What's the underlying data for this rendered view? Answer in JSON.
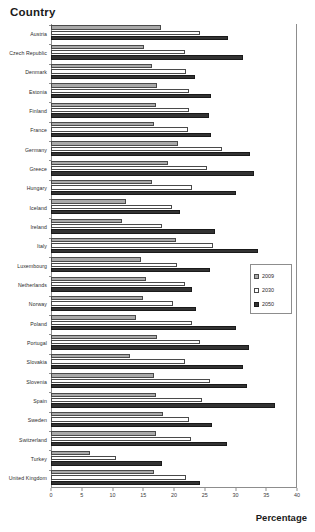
{
  "chart_data": {
    "type": "bar",
    "orientation": "horizontal",
    "title": "Country",
    "xlabel": "Percentage",
    "ylabel": "Country",
    "xlim": [
      0,
      40
    ],
    "xticks": [
      0,
      5,
      10,
      15,
      20,
      25,
      30,
      35,
      40
    ],
    "grid": false,
    "legend_position": "middle-right",
    "categories": [
      "Austria",
      "Czech Republic",
      "Denmark",
      "Estonia",
      "Finland",
      "France",
      "Germany",
      "Greece",
      "Hungary",
      "Iceland",
      "Ireland",
      "Italy",
      "Luxembourg",
      "Netherlands",
      "Norway",
      "Poland",
      "Portugal",
      "Slovakia",
      "Slovenia",
      "Spain",
      "Sweden",
      "Switzerland",
      "Turkey",
      "United Kingdom"
    ],
    "series": [
      {
        "name": "2009",
        "color": "#a9a9a9",
        "values": [
          17.9,
          15.2,
          16.5,
          17.3,
          17.0,
          16.8,
          20.6,
          19.0,
          16.5,
          12.2,
          11.5,
          20.3,
          14.6,
          15.4,
          15.0,
          13.8,
          17.2,
          12.8,
          16.8,
          17.0,
          18.2,
          17.0,
          6.3,
          16.7
        ]
      },
      {
        "name": "2030",
        "color": "#ffffff",
        "values": [
          24.2,
          21.8,
          22.0,
          22.5,
          22.4,
          22.2,
          27.8,
          25.4,
          23.0,
          19.7,
          18.0,
          26.3,
          20.5,
          21.8,
          19.8,
          23.0,
          24.2,
          21.8,
          25.8,
          24.5,
          22.4,
          22.8,
          10.6,
          22.0
        ]
      },
      {
        "name": "2050",
        "color": "#333333",
        "values": [
          28.8,
          31.2,
          23.4,
          26.0,
          25.7,
          26.0,
          32.4,
          33.0,
          30.0,
          21.0,
          26.6,
          33.7,
          25.8,
          23.0,
          23.6,
          30.0,
          32.2,
          31.2,
          31.9,
          36.4,
          26.2,
          28.6,
          18.0,
          24.2
        ]
      }
    ]
  },
  "legend": {
    "items": [
      {
        "label": "2009"
      },
      {
        "label": "2030"
      },
      {
        "label": "2050"
      }
    ]
  }
}
